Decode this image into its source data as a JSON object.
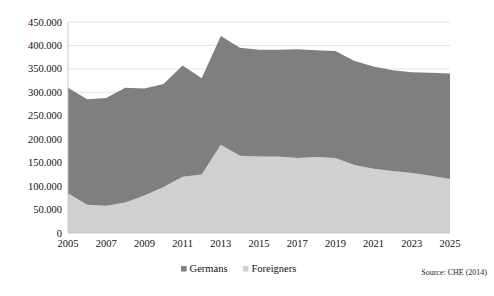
{
  "chart_data": {
    "type": "area",
    "stacked": true,
    "title": "",
    "subtitle": "",
    "xlabel": "",
    "ylabel": "",
    "ylim": [
      0,
      450000
    ],
    "ytick_step": 50000,
    "ytick_labels": [
      "0",
      "50.000",
      "100.000",
      "150.000",
      "200.000",
      "250.000",
      "300.000",
      "350.000",
      "400.000",
      "450.000"
    ],
    "ytick_values": [
      0,
      50000,
      100000,
      150000,
      200000,
      250000,
      300000,
      350000,
      400000,
      450000
    ],
    "xtick_labels": [
      "2005",
      "2007",
      "2009",
      "2011",
      "2013",
      "2015",
      "2017",
      "2019",
      "2021",
      "2023",
      "2025"
    ],
    "xtick_values": [
      2005,
      2007,
      2009,
      2011,
      2013,
      2015,
      2017,
      2019,
      2021,
      2023,
      2025
    ],
    "x": [
      2005,
      2006,
      2007,
      2008,
      2009,
      2010,
      2011,
      2012,
      2013,
      2014,
      2015,
      2016,
      2017,
      2018,
      2019,
      2020,
      2021,
      2022,
      2023,
      2024,
      2025
    ],
    "xlim": [
      2005,
      2025
    ],
    "grid": true,
    "legend_position": "bottom",
    "series": [
      {
        "name": "Germans",
        "color": "#7f7f7f",
        "values": [
          225000,
          225000,
          230000,
          245000,
          228000,
          220000,
          237000,
          205000,
          232000,
          230000,
          228000,
          228000,
          232000,
          228000,
          228000,
          222000,
          218000,
          215000,
          215000,
          220000,
          225000
        ]
      },
      {
        "name": "Foreigners",
        "color": "#d0d0d0",
        "values": [
          85000,
          60000,
          58000,
          65000,
          80000,
          98000,
          120000,
          125000,
          188000,
          165000,
          163000,
          163000,
          160000,
          162000,
          160000,
          145000,
          137000,
          132000,
          128000,
          122000,
          115000
        ]
      }
    ],
    "totals": [
      310000,
      285000,
      288000,
      310000,
      308000,
      318000,
      357000,
      330000,
      420000,
      395000,
      391000,
      391000,
      392000,
      390000,
      388000,
      367000,
      355000,
      347000,
      343000,
      342000,
      340000
    ],
    "source_note": "Source: CHE (2014)"
  },
  "legend": {
    "items": [
      {
        "label": "Germans",
        "color": "#7f7f7f",
        "marker": "square-marker"
      },
      {
        "label": "Foreigners",
        "color": "#d0d0d0",
        "marker": "square-marker"
      }
    ]
  },
  "footer": {
    "source": "Source: CHE (2014)"
  }
}
